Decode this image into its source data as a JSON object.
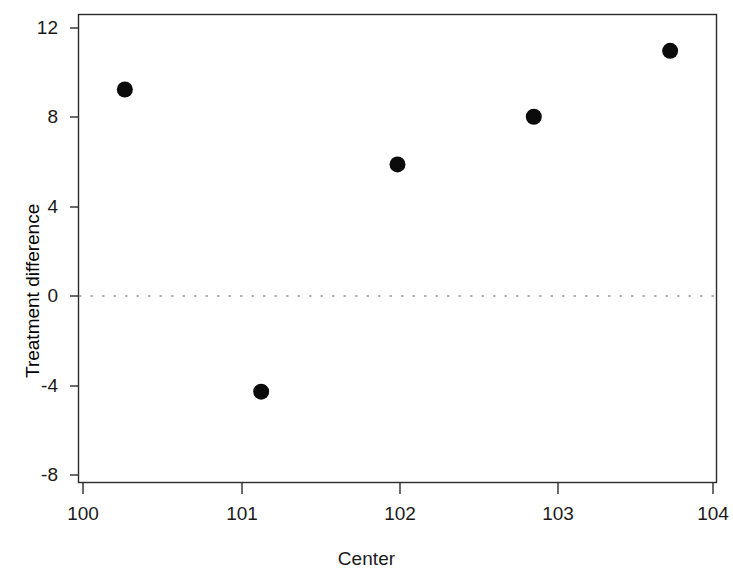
{
  "chart_data": {
    "type": "scatter",
    "title": "",
    "xlabel": "Center",
    "ylabel": "Treatment difference",
    "x": [
      100,
      101,
      102,
      103,
      104
    ],
    "values": [
      9.0,
      -4.3,
      5.7,
      7.8,
      10.7
    ],
    "series": [
      {
        "name": "Treatment difference",
        "x": [
          100,
          101,
          102,
          103,
          104
        ],
        "values": [
          9.0,
          -4.3,
          5.7,
          7.8,
          10.7
        ]
      }
    ],
    "points": [
      {
        "x": 100,
        "y": 9.0
      },
      {
        "x": 101,
        "y": -4.3
      },
      {
        "x": 102,
        "y": 5.7
      },
      {
        "x": 103,
        "y": 7.8
      },
      {
        "x": 104,
        "y": 10.7
      }
    ],
    "xlim": [
      99.66,
      104.34
    ],
    "ylim": [
      -8.3,
      12.3
    ],
    "xticks": [
      100,
      101,
      102,
      103,
      104
    ],
    "yticks": [
      -8,
      -4,
      0,
      4,
      8,
      12
    ],
    "xtick_labels": [
      "100",
      "101",
      "102",
      "103",
      "104"
    ],
    "ytick_labels": [
      "-8",
      "-4",
      "0",
      "4",
      "8",
      "12"
    ],
    "grid": false,
    "legend": null,
    "legend_position": "none",
    "annotations": [
      {
        "name": "zero-reference-line",
        "type": "hline",
        "y": 0,
        "style": "dotted",
        "color": "#9a9a9a"
      }
    ],
    "marker": {
      "shape": "circle",
      "color": "#0b0b0b",
      "size": 11
    },
    "colors": {
      "marker": "#0b0b0b",
      "frame": "#2b2b2b",
      "zero_line": "#9a9a9a",
      "background": "#ffffff",
      "text": "#1a1a1a"
    }
  }
}
